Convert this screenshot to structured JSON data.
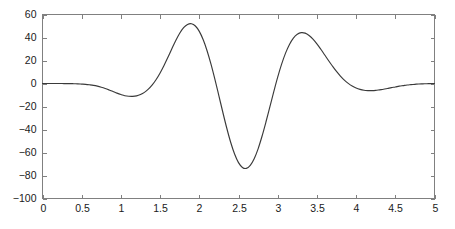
{
  "chart_data": {
    "type": "line",
    "title": "",
    "xlabel": "",
    "ylabel": "",
    "xlim": [
      0,
      5
    ],
    "ylim": [
      -100,
      60
    ],
    "grid": false,
    "legend": null,
    "xticks": [
      0,
      0.5,
      1,
      1.5,
      2,
      2.5,
      3,
      3.5,
      4,
      4.5,
      5
    ],
    "xticklabels": [
      "0",
      "0.5",
      "1",
      "1.5",
      "2",
      "2.5",
      "3",
      "3.5",
      "4",
      "4.5",
      "5"
    ],
    "yticks": [
      60,
      40,
      20,
      0,
      -20,
      -40,
      -60,
      -80,
      -100
    ],
    "yticklabels": [
      "60",
      "40",
      "20",
      "0",
      "−20",
      "−40",
      "−60",
      "−80",
      "−100"
    ],
    "line_color": "#3a3a3a",
    "axis_color": "#808080",
    "background_color": "#ffffff",
    "annotations": [],
    "series": [
      {
        "name": "signal",
        "x": [
          0.0,
          0.05,
          0.1,
          0.15,
          0.2,
          0.25,
          0.3,
          0.35,
          0.4,
          0.45,
          0.5,
          0.55,
          0.6,
          0.65,
          0.7,
          0.75,
          0.8,
          0.85,
          0.9,
          0.95,
          1.0,
          1.05,
          1.1,
          1.15,
          1.2,
          1.25,
          1.3,
          1.35,
          1.4,
          1.45,
          1.5,
          1.55,
          1.6,
          1.65,
          1.7,
          1.75,
          1.8,
          1.85,
          1.9,
          1.95,
          2.0,
          2.05,
          2.1,
          2.15,
          2.2,
          2.25,
          2.3,
          2.35,
          2.4,
          2.45,
          2.5,
          2.55,
          2.6,
          2.65,
          2.7,
          2.75,
          2.8,
          2.85,
          2.9,
          2.95,
          3.0,
          3.05,
          3.1,
          3.15,
          3.2,
          3.25,
          3.3,
          3.35,
          3.4,
          3.45,
          3.5,
          3.55,
          3.6,
          3.65,
          3.7,
          3.75,
          3.8,
          3.85,
          3.9,
          3.95,
          4.0,
          4.05,
          4.1,
          4.15,
          4.2,
          4.25,
          4.3,
          4.35,
          4.4,
          4.45,
          4.5,
          4.55,
          4.6,
          4.65,
          4.7,
          4.75,
          4.8,
          4.85,
          4.9,
          4.95,
          5.0
        ],
        "y": [
          0.0,
          0.0,
          0.0,
          0.0,
          0.0,
          0.0,
          -0.1,
          -0.1,
          -0.2,
          -0.3,
          -0.5,
          -0.7,
          -1.1,
          -1.6,
          -2.3,
          -3.2,
          -4.3,
          -5.6,
          -7.0,
          -8.4,
          -9.6,
          -10.6,
          -11.1,
          -11.2,
          -10.8,
          -9.6,
          -7.7,
          -4.9,
          -1.2,
          3.5,
          9.2,
          15.7,
          22.8,
          30.2,
          37.4,
          43.7,
          48.5,
          51.4,
          52.0,
          50.0,
          45.3,
          38.0,
          28.3,
          16.6,
          3.4,
          -10.7,
          -25.0,
          -38.7,
          -51.1,
          -61.3,
          -68.8,
          -73.0,
          -73.8,
          -71.2,
          -65.4,
          -56.8,
          -45.9,
          -33.5,
          -20.3,
          -7.1,
          5.5,
          16.8,
          26.4,
          34.0,
          39.5,
          42.8,
          44.2,
          43.8,
          41.8,
          38.6,
          34.5,
          29.8,
          24.8,
          19.8,
          15.0,
          10.5,
          6.5,
          3.0,
          0.1,
          -2.2,
          -3.9,
          -5.1,
          -5.9,
          -6.2,
          -6.2,
          -6.0,
          -5.5,
          -5.0,
          -4.3,
          -3.6,
          -3.0,
          -2.3,
          -1.8,
          -1.3,
          -1.0,
          -0.7,
          -0.4,
          -0.3,
          -0.2,
          -0.1,
          0.0
        ]
      }
    ],
    "features": {
      "left_dip_x": 1.27,
      "left_dip_y": -11,
      "first_peak_x": 1.9,
      "first_peak_y": 52,
      "center_trough_x": 2.5,
      "center_trough_y": -83,
      "second_peak_x": 3.1,
      "second_peak_y": 52,
      "right_dip_x": 3.73,
      "right_dip_y": -11
    }
  }
}
